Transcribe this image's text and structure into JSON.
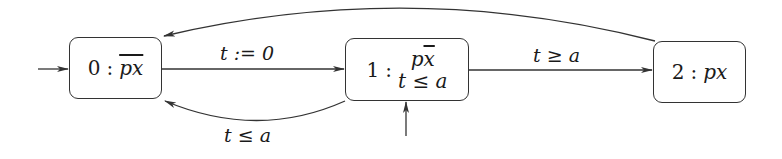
{
  "diagram": {
    "type": "timed-automaton",
    "states": [
      {
        "id": "0",
        "num": "0",
        "colon": ":",
        "prop": "px",
        "prop_overline": "all",
        "invariant": null,
        "initial": true
      },
      {
        "id": "1",
        "num": "1",
        "colon": ":",
        "prop_p": "p",
        "prop_x": "x",
        "prop_x_overline": true,
        "invariant": "t ≤ a",
        "initial": true
      },
      {
        "id": "2",
        "num": "2",
        "colon": ":",
        "prop": "px",
        "invariant": null,
        "initial": false
      }
    ],
    "edges": [
      {
        "from": "0",
        "to": "1",
        "label": "t := 0"
      },
      {
        "from": "1",
        "to": "2",
        "label": "t ≥ a"
      },
      {
        "from": "1",
        "to": "0",
        "label": "t ≤ a"
      },
      {
        "from": "2",
        "to": "0",
        "label": ""
      }
    ],
    "colors": {
      "stroke": "#333333",
      "background": "#ffffff"
    }
  }
}
